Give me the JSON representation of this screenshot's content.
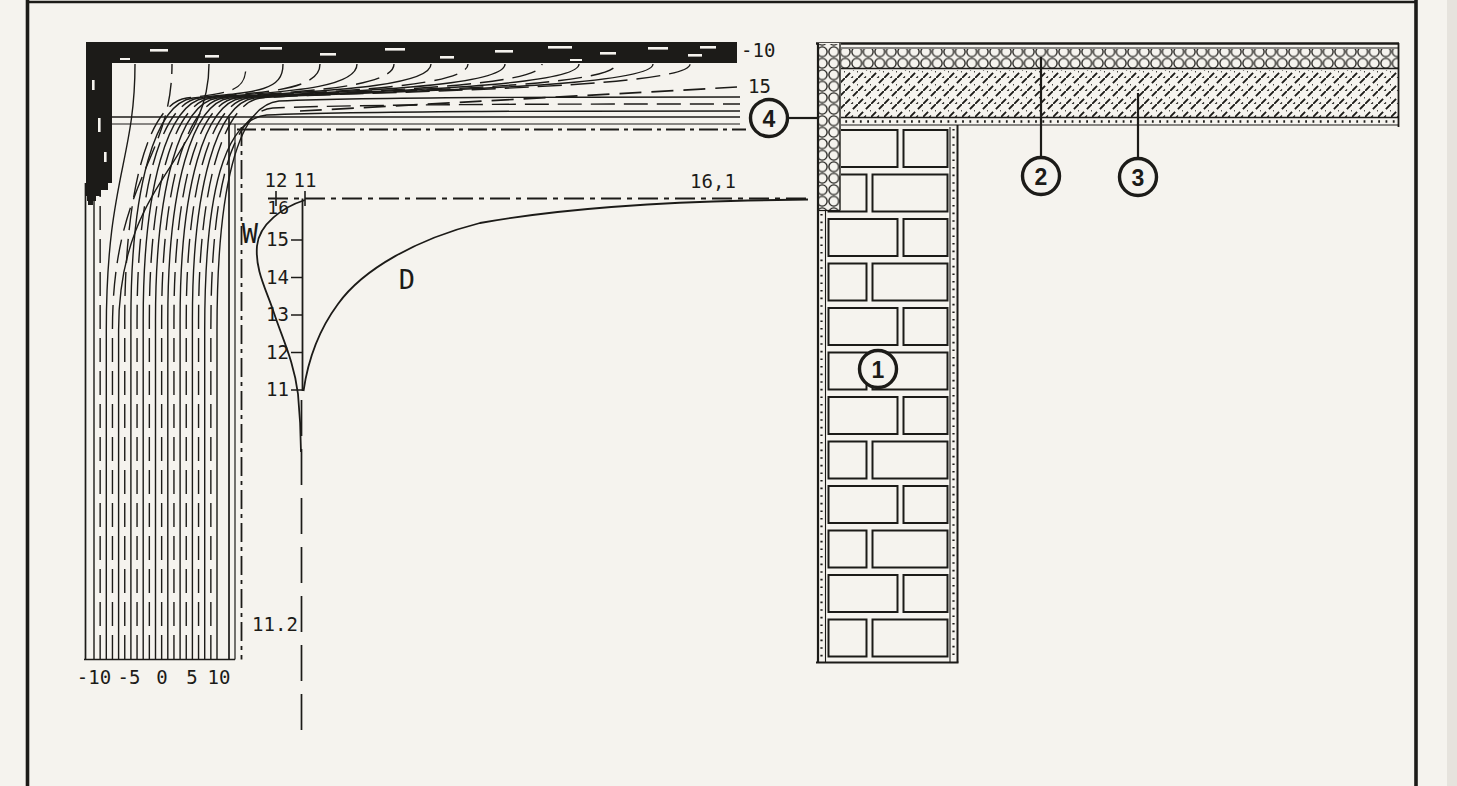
{
  "colors": {
    "paper": "#f5f3ee",
    "ink": "#1c1b18"
  },
  "isotherm_plot": {
    "exterior_temp": "-10",
    "isotherm15": "15",
    "x_ticks": [
      "-10",
      "-5",
      "0",
      "5",
      "10"
    ]
  },
  "profile": {
    "top_ticks": [
      "12",
      "11"
    ],
    "far_value": "16,1",
    "y_ticks": [
      "16",
      "15",
      "14",
      "13",
      "12",
      "11"
    ],
    "wall_label": "W",
    "ceiling_label": "D",
    "bottom_value": "11.2"
  },
  "callouts": [
    "1",
    "2",
    "3",
    "4"
  ],
  "chart_data": [
    {
      "type": "line",
      "title": "isotherm field at wall-roof corner",
      "xlabel": "isotherm temperature",
      "x_ticks": [
        -10,
        -5,
        0,
        5,
        10
      ],
      "isotherm_min": -10,
      "isotherm_max": 10,
      "isotherm_step": 1,
      "labeled_isotherms": [
        -10,
        15
      ],
      "grid": false
    },
    {
      "type": "line",
      "title": "interior surface temperature profiles",
      "y_axis_ticks": [
        16,
        15,
        14,
        13,
        12,
        11
      ],
      "top_axis_ticks": [
        12,
        11
      ],
      "series": [
        {
          "name": "W",
          "corner_value": 11,
          "peak_value": 12.6,
          "far_value": 11.2
        },
        {
          "name": "D",
          "corner_value": 11,
          "far_value": 16.1
        }
      ]
    }
  ]
}
